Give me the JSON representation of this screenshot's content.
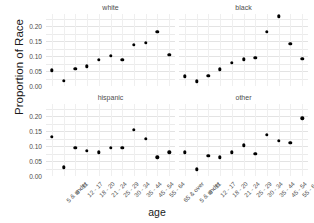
{
  "chart_data": {
    "type": "scatter",
    "title": "",
    "xlabel": "age",
    "ylabel": "Proportion of Race",
    "ylim": [
      0.0,
      0.24
    ],
    "yticks": [
      "0.00",
      "0.05",
      "0.10",
      "0.15",
      "0.20"
    ],
    "ytick_values": [
      0.0,
      0.05,
      0.1,
      0.15,
      0.2
    ],
    "grid": true,
    "legend": "none",
    "facet_layout": "2x2",
    "categories": [
      "5 & under",
      "6 - 11",
      "12 - 17",
      "18 - 20",
      "21 - 24",
      "25 - 29",
      "30 - 34",
      "35 - 44",
      "45 - 54",
      "55 - 64",
      "65 & over"
    ],
    "panels": [
      {
        "name": "white",
        "position": "top-left",
        "values": [
          0.052,
          0.017,
          0.057,
          0.066,
          0.087,
          0.1,
          0.088,
          0.137,
          0.143,
          0.181,
          0.104
        ]
      },
      {
        "name": "black",
        "position": "top-right",
        "values": [
          0.032,
          0.016,
          0.035,
          0.056,
          0.078,
          0.089,
          0.093,
          0.181,
          0.232,
          0.14,
          0.091
        ]
      },
      {
        "name": "hispanic",
        "position": "bottom-left",
        "values": [
          0.131,
          0.029,
          0.095,
          0.084,
          0.079,
          0.095,
          0.094,
          0.153,
          0.125,
          0.062,
          0.079
        ]
      },
      {
        "name": "other",
        "position": "bottom-right",
        "values": [
          0.079,
          0.022,
          0.068,
          0.062,
          0.079,
          0.102,
          0.073,
          0.138,
          0.118,
          0.111,
          0.192
        ]
      }
    ]
  },
  "colors": {
    "point": "#000000",
    "gridline": "#ebebeb",
    "panel_background": "#ffffff",
    "axis_text": "#4d4d4d",
    "axis_title": "#1a1a1a"
  }
}
